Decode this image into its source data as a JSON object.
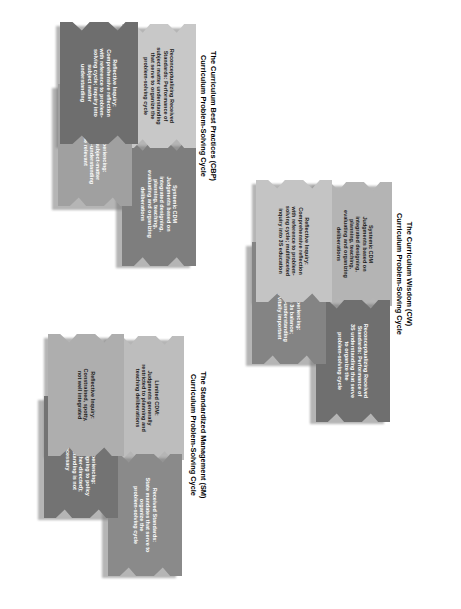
{
  "page": {
    "background_color": "#ffffff",
    "orientation": "rotated-90",
    "width": 461,
    "height": 609
  },
  "diagrams": [
    {
      "id": "cbp",
      "caption": "The Curriculum Best Practices (CBP)\nCurriculum Problem-Solving Cycle",
      "blocks": [
        {
          "key": "systemic-cdm",
          "label": "Systemic CDM\nJudgments based on\nintegrated designing,\nplanning, teaching,\nevaluating and organizing\ndeliberations",
          "color": "#7e7e7e"
        },
        {
          "key": "reconceptualizing-received-standards",
          "label": "Reconceptualizing Received\nStandards: Performance of\nsubject matter understanding\nthat serve to organize the\nproblem-solving cycle",
          "color": "#c8c8c8"
        },
        {
          "key": "acting-experiencing",
          "label": "Acting/Experiencing:\nFocused on subject-matter\ndiscipline; self-understanding\nmay be relevant",
          "color": "#a0a0a0"
        },
        {
          "key": "reflective-inquiry",
          "label": "Reflective Inquiry:\nComprehensive reflection\nwith reference to problem-\nsolving cycle; inquiry into\nsubject matter\nunderstanding",
          "color": "#6e6e6e"
        }
      ]
    },
    {
      "id": "sm",
      "caption": "The Standardized Management (SM)\nCurriculum Problem-Solving Cycle",
      "blocks": [
        {
          "key": "limited-cdm",
          "label": "Limited CDM:\nJudgments generally\nrestricted to planning and\nteaching deliberations",
          "color": "#bdbdbd"
        },
        {
          "key": "received-standards",
          "label": "Received Standards:\nState mandates that serve to\norganize the\nproblem-solving cycle",
          "color": "#8a8a8a"
        },
        {
          "key": "acting-experiencing",
          "label": "Acting/Experiencing:\nFocused on aligning to policy\nmandates (other-directed);\nself-understanding is not\nnecessary",
          "color": "#737373"
        },
        {
          "key": "reflective-inquiry",
          "label": "Reflective Inquiry:\nConstrained, spotty,\nnot well integrated",
          "color": "#aeaeae"
        }
      ]
    },
    {
      "id": "cw",
      "caption": "The Curriculum Wisdom (CW)\nCurriculum Problem-Solving Cycle",
      "blocks": [
        {
          "key": "systemic-cdm",
          "label": "Systemic CDM\nJudgments based on\nintegrated designing,\nplanning, teaching,\nevaluating and organizing\ndeliberations",
          "color": "#b4b4b4"
        },
        {
          "key": "reconceptualizing-received-standards",
          "label": "Reconceptualizing Received\nStandards: Performance of\n3S understanding that serve\nto organize the\nproblem-solving cycle",
          "color": "#6f6f6f"
        },
        {
          "key": "acting-experiencing",
          "label": "Acting/Experiencing:\nFocused on 3s balance;\njourney of self-understanding\n(currere) is vitally important",
          "color": "#848484"
        },
        {
          "key": "reflective-inquiry",
          "label": "Reflective Inquiry:\nComprehensive reflection\nwith reference to problem-\nsolving cycle; multifaceted\ninquiry into 3S education",
          "color": "#c4c4c4"
        }
      ]
    }
  ]
}
